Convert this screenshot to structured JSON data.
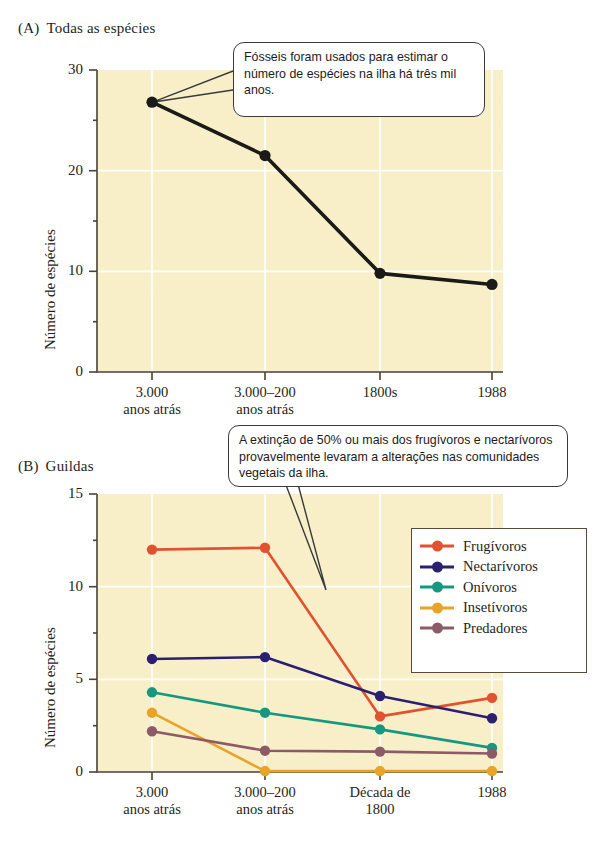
{
  "panelA": {
    "tag": "(A)",
    "title": "Todas as espécies",
    "ylabel": "Número de espécies",
    "callout": "Fósseis foram usados para estimar o número de espécies na ilha há três mil anos."
  },
  "panelB": {
    "tag": "(B)",
    "title": "Guildas",
    "ylabel": "Número de espécies",
    "callout": "A extinção de 50% ou mais dos frugívoros e nectarívoros provavelmente levaram a alterações nas comunidades vegetais da ilha."
  },
  "chart_data": [
    {
      "type": "line",
      "title": "(A) Todas as espécies",
      "xlabel": "",
      "ylabel": "Número de espécies",
      "categories": [
        "3.000 anos atrás",
        "3.000–200 anos atrás",
        "1800s",
        "1988"
      ],
      "tick_labels_line1": [
        "3.000",
        "3.000–200",
        "1800s",
        "1988"
      ],
      "tick_labels_line2": [
        "anos atrás",
        "anos atrás",
        "",
        ""
      ],
      "ylim": [
        0,
        30
      ],
      "yticks": [
        0,
        10,
        20,
        30
      ],
      "grid": true,
      "legend": "none",
      "series": [
        {
          "name": "Todas as espécies",
          "color": "#1a1a16",
          "values": [
            26.8,
            21.5,
            9.8,
            8.7
          ]
        }
      ],
      "annotations": [
        {
          "text": "Fósseis foram usados para estimar o número de espécies na ilha há três mil anos.",
          "points_to": "3.000 anos atrás"
        }
      ]
    },
    {
      "type": "line",
      "title": "(B) Guildas",
      "xlabel": "",
      "ylabel": "Número de espécies",
      "categories": [
        "3.000 anos atrás",
        "3.000–200 anos atrás",
        "Década de 1800",
        "1988"
      ],
      "tick_labels_line1": [
        "3.000",
        "3.000–200",
        "Década de",
        "1988"
      ],
      "tick_labels_line2": [
        "anos atrás",
        "anos atrás",
        "1800",
        ""
      ],
      "ylim": [
        0,
        15
      ],
      "yticks": [
        0,
        5,
        10,
        15
      ],
      "grid": true,
      "legend": "right-inside",
      "series": [
        {
          "name": "Frugívoros",
          "color": "#e05230",
          "values": [
            12.0,
            12.1,
            3.0,
            4.0
          ]
        },
        {
          "name": "Nectarívoros",
          "color": "#2b2070",
          "values": [
            6.1,
            6.2,
            4.1,
            2.9
          ]
        },
        {
          "name": "Onívoros",
          "color": "#14987f",
          "values": [
            4.3,
            3.2,
            2.3,
            1.3
          ]
        },
        {
          "name": "Insetívoros",
          "color": "#e8a427",
          "values": [
            3.2,
            0.05,
            0.05,
            0.05
          ]
        },
        {
          "name": "Predadores",
          "color": "#8d5b68",
          "values": [
            2.2,
            1.15,
            1.1,
            1.0
          ]
        }
      ],
      "annotations": [
        {
          "text": "A extinção de 50% ou mais dos frugívoros e nectarívoros provavelmente levaram a alterações nas comunidades vegetais da ilha.",
          "points_to": "Frugívoros decline"
        }
      ]
    }
  ]
}
